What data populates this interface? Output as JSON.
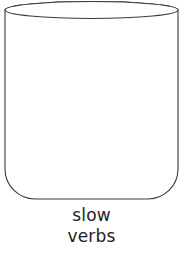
{
  "figure": {
    "kind": "line-drawing",
    "background_color": "#ffffff",
    "stroke_color": "#3a3a3a",
    "fill_color": "#ffffff",
    "stroke_width": 1.1,
    "shape": {
      "name": "jar",
      "body_left_x": 5,
      "body_right_x": 178,
      "body_top_y": 10,
      "body_bottom_y": 199,
      "bottom_corner_radius": 30,
      "opening_ellipse": {
        "center_x": 91.5,
        "center_y": 10,
        "radius_x": 86.5,
        "radius_y": 8.5
      }
    }
  },
  "caption": {
    "lines": [
      "slow",
      "verbs"
    ],
    "line1": "slow",
    "line2": "verbs",
    "text_color": "#222222",
    "align": "center"
  }
}
